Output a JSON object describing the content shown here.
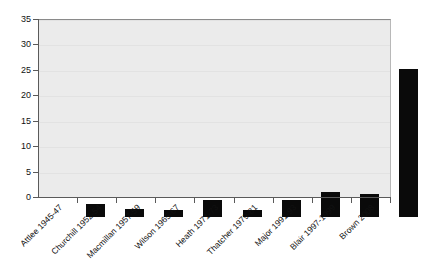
{
  "chart_data": {
    "type": "bar",
    "title": "",
    "subtitle": "",
    "xlabel": "",
    "ylabel": "",
    "categories": [
      "Attlee 1945-47",
      "Churchill 1952-54",
      "Macmillan 1957-59",
      "Wilson 1965-67",
      "Heath 1971-73",
      "Thatcher 1979-81",
      "Major 1991-93",
      "Blair 1997-1999",
      "Brown 2008"
    ],
    "values": [
      2.5,
      1.5,
      1.3,
      3.3,
      1.4,
      3.4,
      5.0,
      4.6,
      29.2
    ],
    "ylim": [
      0,
      35
    ],
    "ytick_labels": [
      "0",
      "5",
      "10",
      "15",
      "20",
      "25",
      "30",
      "35"
    ],
    "ytick_values": [
      0,
      5,
      10,
      15,
      20,
      25,
      30,
      35
    ],
    "grid": true,
    "legend": false,
    "legend_position": "none",
    "bar_color": "#0a0a0a",
    "plot_background": "#ebebeb",
    "figure_background": "#ffffff",
    "gridline_color": "#e2e2e2",
    "axis_color": "#5a5a5a",
    "xtick_label_rotation": -45
  }
}
